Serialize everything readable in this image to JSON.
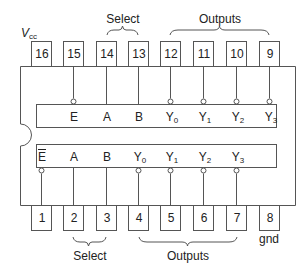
{
  "diagram": {
    "type": "IC pinout",
    "stroke_color": "#555555",
    "text_color": "#222222",
    "power_label": {
      "main": "V",
      "sub": "cc"
    },
    "ground_label": "gnd",
    "top_pins": [
      {
        "number": "16",
        "x": 41
      },
      {
        "number": "15",
        "x": 73
      },
      {
        "number": "14",
        "x": 106
      },
      {
        "number": "13",
        "x": 138
      },
      {
        "number": "12",
        "x": 170
      },
      {
        "number": "11",
        "x": 203
      },
      {
        "number": "10",
        "x": 236
      },
      {
        "number": "9",
        "x": 269
      }
    ],
    "bottom_pins": [
      {
        "number": "1",
        "x": 41
      },
      {
        "number": "2",
        "x": 73
      },
      {
        "number": "3",
        "x": 106
      },
      {
        "number": "4",
        "x": 138
      },
      {
        "number": "5",
        "x": 170
      },
      {
        "number": "6",
        "x": 203
      },
      {
        "number": "7",
        "x": 236
      },
      {
        "number": "8",
        "x": 269
      }
    ],
    "top_group_labels": {
      "select": "Select",
      "outputs": "Outputs"
    },
    "bottom_group_labels": {
      "select": "Select",
      "outputs": "Outputs"
    },
    "upper_decoder": {
      "signals": [
        {
          "main": "E",
          "sub": "",
          "bar": false,
          "x": 73
        },
        {
          "main": "A",
          "sub": "",
          "bar": false,
          "x": 106
        },
        {
          "main": "B",
          "sub": "",
          "bar": false,
          "x": 138
        },
        {
          "main": "Y",
          "sub": "0",
          "bar": false,
          "x": 170
        },
        {
          "main": "Y",
          "sub": "1",
          "bar": false,
          "x": 203
        },
        {
          "main": "Y",
          "sub": "2",
          "bar": false,
          "x": 236
        },
        {
          "main": "Y",
          "sub": "3",
          "bar": false,
          "x": 269
        }
      ]
    },
    "lower_decoder": {
      "signals": [
        {
          "main": "E",
          "sub": "",
          "bar": true,
          "x": 41
        },
        {
          "main": "A",
          "sub": "",
          "bar": false,
          "x": 73
        },
        {
          "main": "B",
          "sub": "",
          "bar": false,
          "x": 106
        },
        {
          "main": "Y",
          "sub": "0",
          "bar": false,
          "x": 138
        },
        {
          "main": "Y",
          "sub": "1",
          "bar": false,
          "x": 170
        },
        {
          "main": "Y",
          "sub": "2",
          "bar": false,
          "x": 203
        },
        {
          "main": "Y",
          "sub": "3",
          "bar": false,
          "x": 236
        }
      ]
    }
  }
}
